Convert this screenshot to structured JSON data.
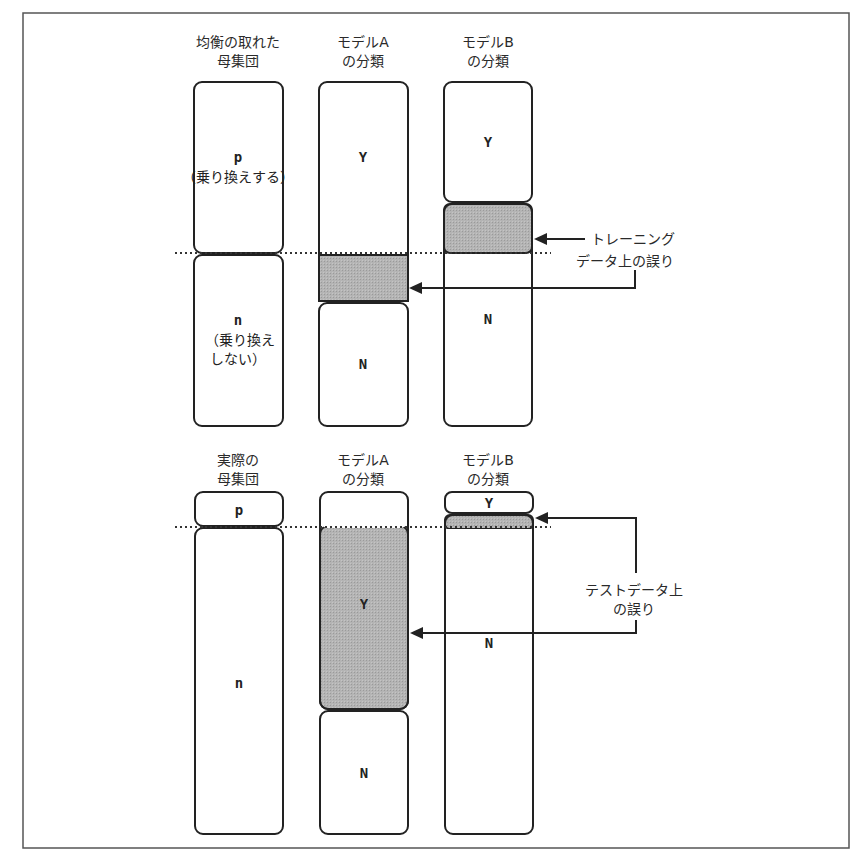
{
  "figure": {
    "top_section": {
      "headers": [
        {
          "line1": "均衡の取れた",
          "line2": "母集団"
        },
        {
          "line1": "モデルA",
          "line2": "の分類"
        },
        {
          "line1": "モデルB",
          "line2": "の分類"
        }
      ],
      "population": {
        "p_label": "p",
        "p_desc": "（乗り換えする）",
        "n_label": "n",
        "n_desc_line1": "（乗り換え",
        "n_desc_line2": "しない）"
      },
      "model_a": {
        "y_label": "Y",
        "n_label": "N"
      },
      "model_b": {
        "y_label": "Y",
        "n_label": "N"
      },
      "annotation": {
        "line1": "トレーニング",
        "line2": "データ上の誤り"
      }
    },
    "bottom_section": {
      "headers": [
        {
          "line1": "実際の",
          "line2": "母集団"
        },
        {
          "line1": "モデルA",
          "line2": "の分類"
        },
        {
          "line1": "モデルB",
          "line2": "の分類"
        }
      ],
      "population": {
        "p_label": "p",
        "n_label": "n"
      },
      "model_a": {
        "y_label": "Y",
        "n_label": "N"
      },
      "model_b": {
        "y_label": "Y",
        "n_label": "N"
      },
      "annotation": {
        "line1": "テストデータ上",
        "line2": "の誤り"
      }
    },
    "colors": {
      "error_fill": "#b0b0b0",
      "stroke": "#222222",
      "frame": "#555555"
    }
  }
}
